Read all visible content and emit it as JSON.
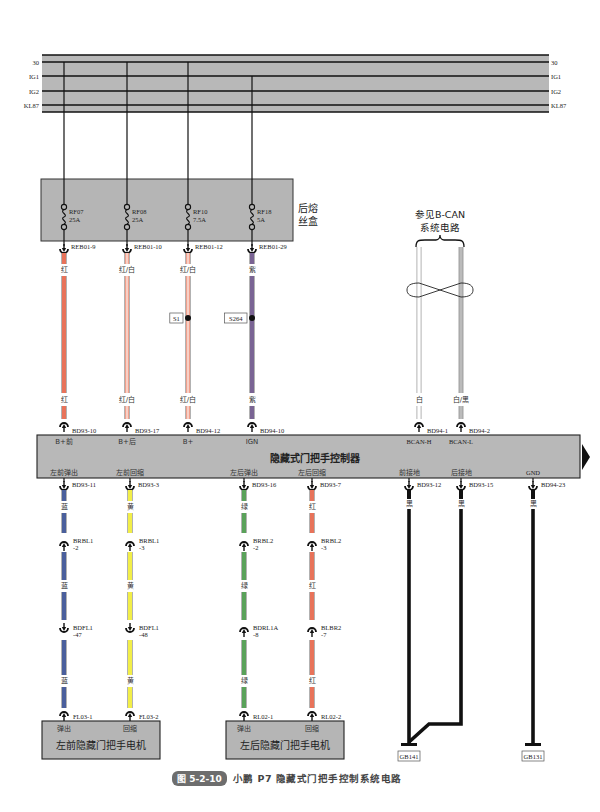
{
  "power_rails": {
    "labels": [
      "30",
      "IG1",
      "IG2",
      "KL87"
    ],
    "y": [
      62,
      76,
      91,
      105
    ],
    "x_start": 42,
    "x_end": 549,
    "fill": "#b8b8b8"
  },
  "fuse_box": {
    "label_line1": "后熔",
    "label_line2": "丝盒",
    "fill": "#b5b5b5",
    "fuses": [
      {
        "id": "RF07",
        "rating": "25A",
        "x": 64,
        "rail": "30",
        "pin": "REB01-9"
      },
      {
        "id": "RF08",
        "rating": "25A",
        "x": 127,
        "rail": "30",
        "pin": "REB01-10"
      },
      {
        "id": "RF10",
        "rating": "7.5A",
        "x": 188,
        "rail": "30",
        "pin": "REB01-12"
      },
      {
        "id": "RF18",
        "rating": "5A",
        "x": 252,
        "rail": "IG1",
        "pin": "REB01-29"
      }
    ]
  },
  "upper_wires": [
    {
      "x": 64,
      "color_label": "红",
      "color": "#e8735a",
      "stripe": null,
      "splice": null,
      "end_pin": "BD93-10",
      "ctrl_pin": "B+前"
    },
    {
      "x": 127,
      "color_label": "红/白",
      "color": "#f0a08c",
      "stripe": "#ffffff",
      "splice": null,
      "end_pin": "BD93-17",
      "ctrl_pin": "B+后"
    },
    {
      "x": 188,
      "color_label": "红/白",
      "color": "#f0a08c",
      "stripe": "#ffffff",
      "splice": "S1",
      "end_pin": "BD94-12",
      "ctrl_pin": "B+"
    },
    {
      "x": 252,
      "color_label": "紫",
      "color": "#7a6494",
      "stripe": null,
      "splice": "S264",
      "end_pin": "BD94-10",
      "ctrl_pin": "IGN"
    }
  ],
  "can_bus": {
    "note_line1": "参见B-CAN",
    "note_line2": "系统电路",
    "wires": [
      {
        "x": 419,
        "color_label": "白",
        "color": "#ffffff",
        "end_pin": "BD94-1",
        "ctrl_pin": "BCAN-H"
      },
      {
        "x": 461,
        "color_label": "白/黑",
        "color": "#bbbbbb",
        "end_pin": "BD94-2",
        "ctrl_pin": "BCAN-L"
      }
    ]
  },
  "controller": {
    "title": "隐藏式门把手控制器",
    "fill": "#b8b8b8",
    "bottom_pins": [
      "左前弹出",
      "左前回缩",
      "左后弹出",
      "左后回缩",
      "前接地",
      "后接地",
      "GND"
    ]
  },
  "lower_wires": [
    {
      "x": 64,
      "ctrl_pin_label": "左前弹出",
      "top_pin": "BD93-11",
      "color_label": "蓝",
      "color": "#4a5f9c",
      "inline1": "BRBL1",
      "inline1_pin": "-2",
      "inline2": "BDFL1",
      "inline2_pin": "-47",
      "motor_pin": "FL03-1",
      "motor_label": "弹出"
    },
    {
      "x": 130,
      "ctrl_pin_label": "左前回缩",
      "top_pin": "BD93-3",
      "color_label": "黄",
      "color": "#f2ee48",
      "inline1": "BRBL1",
      "inline1_pin": "-3",
      "inline2": "BDFL1",
      "inline2_pin": "-48",
      "motor_pin": "FL03-2",
      "motor_label": "回缩"
    },
    {
      "x": 244,
      "ctrl_pin_label": "左后弹出",
      "top_pin": "BD93-16",
      "color_label": "绿",
      "color": "#5aa25a",
      "inline1": "BRBL2",
      "inline1_pin": "-2",
      "inline2": "BDRL1A",
      "inline2_pin": "-8",
      "motor_pin": "RL02-1",
      "motor_label": "弹出"
    },
    {
      "x": 312,
      "ctrl_pin_label": "左后回缩",
      "top_pin": "BD93-7",
      "color_label": "红",
      "color": "#e8735a",
      "inline1": "BRBL2",
      "inline1_pin": "-3",
      "inline2": "BLBR2",
      "inline2_pin": "-7",
      "motor_pin": "RL02-2",
      "motor_label": "回缩"
    }
  ],
  "ground_wires": [
    {
      "x": 409,
      "ctrl_pin_label": "前接地",
      "top_pin": "BD93-12",
      "color_label": "黑",
      "ground": "GB141"
    },
    {
      "x": 461,
      "ctrl_pin_label": "后接地",
      "top_pin": "BD93-15",
      "color_label": "黑",
      "ground": "GB141"
    },
    {
      "x": 533,
      "ctrl_pin_label": "GND",
      "top_pin": "BD94-23",
      "color_label": "黑",
      "ground": "GB131"
    }
  ],
  "motors": [
    {
      "label": "左前隐藏门把手电机",
      "pin_labels": [
        "弹出",
        "回缩"
      ]
    },
    {
      "label": "左后隐藏门把手电机",
      "pin_labels": [
        "弹出",
        "回缩"
      ]
    }
  ],
  "caption": {
    "figure_number": "图 5-2-10",
    "title": "小鹏 P7 隐藏式门把手控制系统电路"
  }
}
